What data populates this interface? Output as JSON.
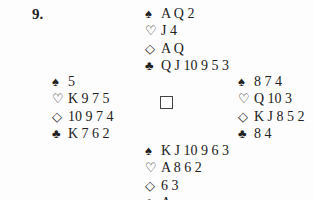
{
  "problem_number": "9.",
  "suit_symbols": {
    "spades": "♠",
    "hearts": "♡",
    "diamonds": "◇",
    "clubs": "♣"
  },
  "hands": {
    "north": {
      "spades": "A Q 2",
      "hearts": "J 4",
      "diamonds": "A Q",
      "clubs": "Q J 10 9 5 3"
    },
    "west": {
      "spades": "5",
      "hearts": "K 9 7 5",
      "diamonds": "10 9 7 4",
      "clubs": "K 7 6 2"
    },
    "east": {
      "spades": "8 7 4",
      "hearts": "Q 10 3",
      "diamonds": "K J 8 5 2",
      "clubs": "8 4"
    },
    "south": {
      "spades": "K J 10 9 6 3",
      "hearts": "A 8 6 2",
      "diamonds": "6 3",
      "clubs": "A"
    }
  }
}
